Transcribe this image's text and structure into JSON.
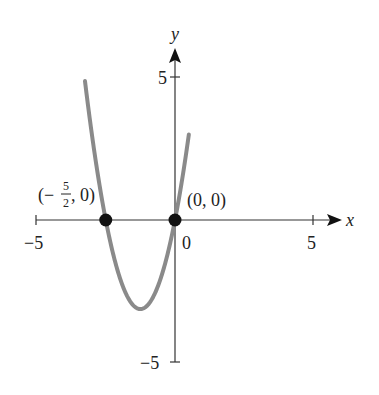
{
  "chart_data": {
    "type": "line",
    "title": "",
    "xlabel": "x",
    "ylabel": "y",
    "xlim": [
      -5,
      5
    ],
    "ylim": [
      -5,
      5
    ],
    "x_ticks": [
      -5,
      5
    ],
    "y_ticks": [
      5,
      -5
    ],
    "x_tick_labels": [
      "−5",
      "5"
    ],
    "y_tick_labels": [
      "5",
      "−5"
    ],
    "origin_label": "0",
    "grid": false,
    "legend": null,
    "function": "y = 2x^2 + 5x",
    "series": [
      {
        "name": "parabola",
        "color": "#8a8a8a",
        "x": [
          -3.25,
          -3.0,
          -2.5,
          -2.0,
          -1.5,
          -1.25,
          -1.0,
          -0.5,
          0.0,
          0.5
        ],
        "y": [
          4.875,
          3.0,
          0.0,
          -2.0,
          -3.0,
          -3.125,
          -3.0,
          -2.0,
          0.0,
          3.5
        ]
      }
    ],
    "points": [
      {
        "x": -2.5,
        "y": 0,
        "label": "(−5/2, 0)",
        "label_num": "5",
        "label_den": "2"
      },
      {
        "x": 0,
        "y": 0,
        "label": "(0, 0)"
      }
    ],
    "vertex": {
      "x": -1.25,
      "y": -3.125
    }
  },
  "labels": {
    "x_axis": "x",
    "y_axis": "y",
    "x_neg5": "−5",
    "x_pos5": "5",
    "y_pos5": "5",
    "y_neg5": "−5",
    "origin": "0",
    "point_origin": "(0, 0)",
    "point_left_open": "(−",
    "point_left_num": "5",
    "point_left_den": "2",
    "point_left_close": ", 0)"
  },
  "colors": {
    "curve": "#8a8a8a",
    "axis": "#333333",
    "point": "#111111"
  }
}
